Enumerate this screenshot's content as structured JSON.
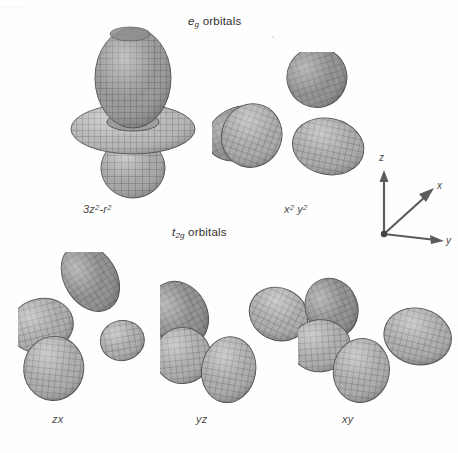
{
  "figure": {
    "width": 458,
    "height": 453,
    "background": "#ffffff",
    "ink": "#3a3a3a",
    "mesh_light": "#c9c9c9",
    "mesh_mid": "#9a9a9a",
    "mesh_dark": "#6e6e6e",
    "top_fragment": ". .  ..   .     ."
  },
  "groups": [
    {
      "id": "eg",
      "label_prefix": "e",
      "label_sub": "g",
      "label_suffix": " orbitals"
    },
    {
      "id": "t2g",
      "label_prefix": "t",
      "label_sub": "2g",
      "label_suffix": " orbitals"
    }
  ],
  "orbitals": [
    {
      "id": "dz2",
      "caption_html": "3z<sup>2</sup>-r<sup>2</sup>",
      "caption_text": "3z2-r2",
      "group": "eg"
    },
    {
      "id": "dx2y2",
      "caption_html": "x<sup>2</sup> y<sup>2</sup>",
      "caption_text": "x2 y2",
      "group": "eg"
    },
    {
      "id": "dzx",
      "caption_html": "zx",
      "caption_text": "zx",
      "group": "t2g"
    },
    {
      "id": "dyz",
      "caption_html": "yz",
      "caption_text": "yz",
      "group": "t2g"
    },
    {
      "id": "dxy",
      "caption_html": "xy",
      "caption_text": "xy",
      "group": "t2g"
    }
  ],
  "axes": {
    "z_label": "z",
    "x_label": "x",
    "y_label": "y"
  }
}
